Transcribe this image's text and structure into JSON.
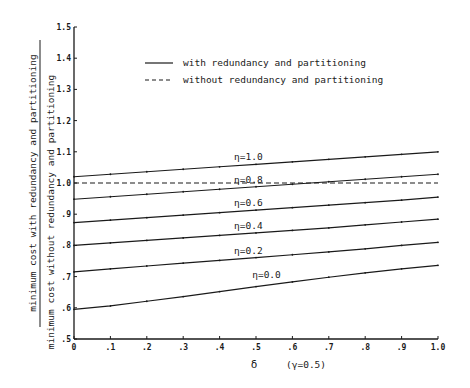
{
  "chart_data": {
    "type": "line",
    "title": "",
    "xlabel": "δ",
    "xlabel_note": "(γ=0.5)",
    "ylabel_numerator": "minimum cost with redundancy and partitioning",
    "ylabel_denominator": "minimum cost without redundancy and partitioning",
    "xlim": [
      0,
      1.0
    ],
    "ylim": [
      0.5,
      1.5
    ],
    "grid": false,
    "legend_position": "upper-center",
    "x_tick_labels": [
      "0",
      ".1",
      ".2",
      ".3",
      ".4",
      ".5",
      ".6",
      ".7",
      ".8",
      ".9",
      "1.0"
    ],
    "y_tick_labels": [
      ".5",
      ".6",
      ".7",
      ".8",
      ".9",
      "1.0",
      "1.1",
      "1.2",
      "1.3",
      "1.4",
      "1.5"
    ],
    "x": [
      0,
      0.1,
      0.2,
      0.3,
      0.4,
      0.5,
      0.6,
      0.7,
      0.8,
      0.9,
      1.0
    ],
    "legend": [
      {
        "label": "with redundancy and partitioning",
        "style": "solid"
      },
      {
        "label": "without redundancy and partitioning",
        "style": "dashed"
      }
    ],
    "series": [
      {
        "name": "η=1.0",
        "style": "solid",
        "label_x": 0.5,
        "values": [
          1.02,
          1.028,
          1.036,
          1.044,
          1.052,
          1.06,
          1.068,
          1.076,
          1.084,
          1.092,
          1.1
        ]
      },
      {
        "name": "η=0.8",
        "style": "solid",
        "label_x": 0.5,
        "values": [
          0.948,
          0.956,
          0.964,
          0.972,
          0.98,
          0.988,
          0.996,
          1.004,
          1.012,
          1.02,
          1.028
        ]
      },
      {
        "name": "η=0.6",
        "style": "solid",
        "label_x": 0.5,
        "values": [
          0.873,
          0.881,
          0.889,
          0.897,
          0.905,
          0.913,
          0.921,
          0.929,
          0.937,
          0.945,
          0.955
        ]
      },
      {
        "name": "η=0.4",
        "style": "solid",
        "label_x": 0.5,
        "values": [
          0.8,
          0.808,
          0.816,
          0.824,
          0.832,
          0.84,
          0.848,
          0.856,
          0.866,
          0.875,
          0.884
        ]
      },
      {
        "name": "η=0.2",
        "style": "solid",
        "label_x": 0.5,
        "values": [
          0.715,
          0.725,
          0.734,
          0.743,
          0.752,
          0.761,
          0.77,
          0.779,
          0.789,
          0.8,
          0.81
        ]
      },
      {
        "name": "η=0.0",
        "style": "solid",
        "label_x": 0.55,
        "values": [
          0.595,
          0.606,
          0.621,
          0.636,
          0.652,
          0.668,
          0.683,
          0.698,
          0.712,
          0.725,
          0.736
        ]
      },
      {
        "name": "without redundancy and partitioning",
        "style": "dashed",
        "label_x": null,
        "values": [
          1.0,
          1.0,
          1.0,
          1.0,
          1.0,
          1.0,
          1.0,
          1.0,
          1.0,
          1.0,
          1.0
        ]
      }
    ]
  },
  "plot_area": {
    "left": 74,
    "right": 438,
    "top": 27,
    "bottom": 339
  }
}
